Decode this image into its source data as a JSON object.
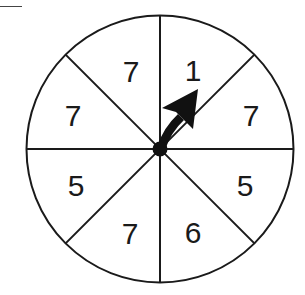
{
  "spinner": {
    "center": {
      "x": 160,
      "y": 149
    },
    "radius": 133.5,
    "hub_radius": 7,
    "stroke_color": "#1a1a1a",
    "fill_color": "#ffffff",
    "sectors": [
      {
        "position": "top-left-upper",
        "label": "7",
        "x": 131,
        "y": 71
      },
      {
        "position": "top-right-upper",
        "label": "1",
        "x": 193,
        "y": 70
      },
      {
        "position": "right-upper",
        "label": "7",
        "x": 251,
        "y": 115
      },
      {
        "position": "right-lower",
        "label": "5",
        "x": 245,
        "y": 185
      },
      {
        "position": "bottom-right",
        "label": "6",
        "x": 193,
        "y": 232
      },
      {
        "position": "bottom-left",
        "label": "7",
        "x": 130,
        "y": 233
      },
      {
        "position": "left-lower",
        "label": "5",
        "x": 76,
        "y": 185
      },
      {
        "position": "left-upper",
        "label": "7",
        "x": 73,
        "y": 115
      }
    ],
    "arrow": {
      "points_to": "1",
      "color": "#111111"
    }
  }
}
